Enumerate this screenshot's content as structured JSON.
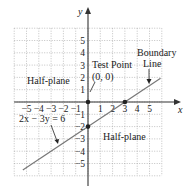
{
  "diagram": {
    "x_axis": {
      "label": "x",
      "range": [
        -6,
        6
      ],
      "ticks": [
        -5,
        -4,
        -3,
        -2,
        -1,
        1,
        2,
        3,
        4,
        5
      ],
      "tick_labels": [
        "−5",
        "−4",
        "−3",
        "−2",
        "−1",
        "1",
        "2",
        "3",
        "4",
        "5"
      ]
    },
    "y_axis": {
      "label": "y",
      "range": [
        -6,
        6
      ],
      "ticks": [
        5,
        4,
        3,
        2,
        1,
        -1,
        -2,
        -3,
        -4,
        -5
      ],
      "tick_labels": [
        "5",
        "4",
        "3",
        "2",
        "1",
        "−1",
        "−2",
        "−3",
        "−4",
        "−5"
      ]
    },
    "grid": "dotted",
    "boundary_line": {
      "equation": "2x − 3y = 6",
      "slope": 0.6667,
      "intercept": -2,
      "x_range": [
        -5.3,
        5.9
      ],
      "color": "#777777"
    },
    "points": [
      {
        "name": "test-point",
        "x": 0,
        "y": 0
      },
      {
        "name": "y-intercept",
        "x": 0,
        "y": -2
      },
      {
        "name": "x-intercept",
        "x": 3,
        "y": 0
      }
    ],
    "annotations": {
      "half_plane_upper": "Half-plane",
      "half_plane_lower": "Half-plane",
      "test_point_line1": "Test Point",
      "test_point_line2": "(0, 0)",
      "boundary_line1": "Boundary",
      "boundary_line2": "Line",
      "equation_label": "2x − 3y = 6"
    }
  }
}
